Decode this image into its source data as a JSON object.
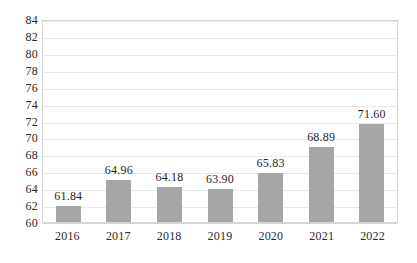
{
  "chart_data": {
    "type": "bar",
    "title": "",
    "subtitle": "",
    "xlabel": "",
    "ylabel": "",
    "categories": [
      "2016",
      "2017",
      "2018",
      "2019",
      "2020",
      "2021",
      "2022"
    ],
    "values": [
      61.84,
      64.96,
      64.18,
      63.9,
      65.83,
      68.89,
      71.6
    ],
    "data_labels": [
      "61.84",
      "64.96",
      "64.18",
      "63.90",
      "65.83",
      "68.89",
      "71.60"
    ],
    "ylim": [
      60,
      84
    ],
    "ytick_step": 2,
    "ytick_labels": [
      "84",
      "82",
      "80",
      "78",
      "76",
      "74",
      "72",
      "70",
      "68",
      "66",
      "64",
      "62",
      "60"
    ],
    "grid": true,
    "grid_axis": "y",
    "legend": false,
    "legend_position": "none",
    "series": [
      {
        "name": "",
        "values": [
          61.84,
          64.96,
          64.18,
          63.9,
          65.83,
          68.89,
          71.6
        ],
        "color": "#a6a6a6"
      }
    ],
    "colors": {
      "bar_fill": "#a6a6a6",
      "gridline": "#e9e9e9",
      "plot_border": "#d5d5d5",
      "text": "#2b2b2b",
      "background": "#ffffff"
    }
  }
}
